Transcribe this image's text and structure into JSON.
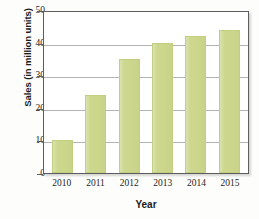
{
  "chart_data": {
    "type": "bar",
    "title": "",
    "categories": [
      "2010",
      "2011",
      "2012",
      "2013",
      "2014",
      "2015"
    ],
    "values": [
      10,
      24,
      35,
      40,
      42,
      44
    ],
    "series": [
      {
        "name": "Sales",
        "values": [
          10,
          24,
          35,
          40,
          42,
          44
        ]
      }
    ],
    "xlabel": "Year",
    "ylabel": "Sales (in million units)",
    "ylim": [
      0,
      50
    ],
    "yticks": [
      0,
      10,
      20,
      30,
      40,
      50
    ],
    "ytick_labels": [
      "0",
      "10",
      "20",
      "30",
      "40",
      "50"
    ],
    "grid": true,
    "grid_axis": "y",
    "legend": false,
    "legend_position": "none",
    "bar_color": "#ccd78c",
    "frame_color": "#5d5d5d",
    "gridline_color": "#b4b4b4",
    "background_color": "#ffffff"
  }
}
